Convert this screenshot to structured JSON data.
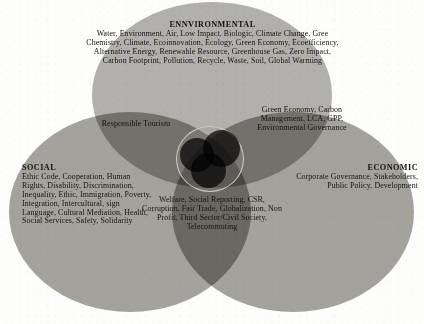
{
  "diagram": {
    "type": "venn",
    "colors": {
      "environmental_fill": "#b4b2ae",
      "social_fill": "#a5a39f",
      "economic_fill": "#a5a39f",
      "text": "#15120f",
      "background": "#fdfdfc",
      "rosette_circle": "#3b3a38"
    }
  },
  "environmental": {
    "heading": "ENNVIRONMENTAL",
    "body": "Water, Environment, Air, Low Impact, Biologic, Climate Change, Gree Chemistry, Climate, Ecoinnovation, Ecology, Green Economy, Ecoefficiency, Alternative Energy, Renewable Resource, Greenhouse Gas, Zero Impact, Carbon Footprint, Pollution, Recycle, Waste, Soil, Global Warming"
  },
  "social": {
    "heading": "SOCIAL",
    "body": "Ethic Code, Cooperation, Human Rights, Disability, Discrimination, Inequality, Ethic, Immigration, Poverty, Integration, Intercultural, sign Language, Cultural Mediation, Health, Social Services, Safety, Solidarity"
  },
  "economic": {
    "heading": "ECONOMIC",
    "body": "Corporate Governance, Stakeholders, Public Policy, Development"
  },
  "overlap_social_environmental": {
    "label": "Responsible Tourism"
  },
  "overlap_environmental_economic": {
    "label": "Green Economy, Carbon Management, LCA, GPP, Environmental Governance"
  },
  "overlap_center": {
    "label": "Welfare, Social Reporting, CSR, Corruption, Fair Trade, Globalization, Non Profit, Third Sector/Civil Society, Telecommuting"
  }
}
